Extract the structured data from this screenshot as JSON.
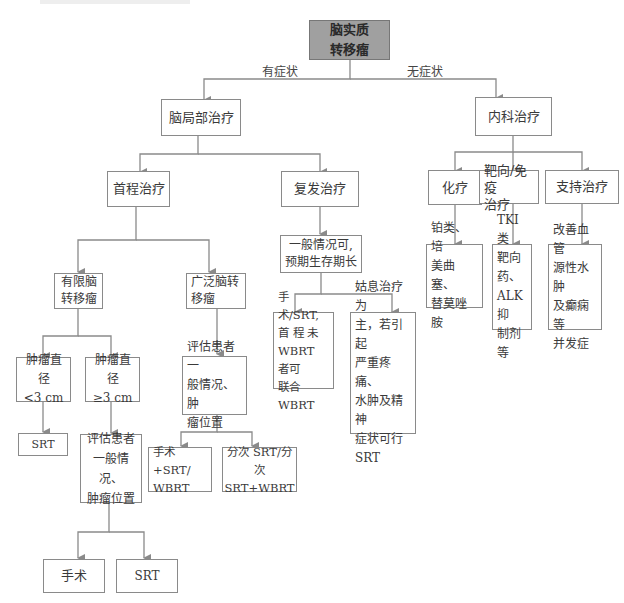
{
  "diagram": {
    "type": "flowchart",
    "root": {
      "id": "root",
      "label": "脑实质\n转移瘤"
    },
    "edge_labels": {
      "symptomatic": "有症状",
      "asymptomatic": "无症状"
    },
    "nodes": {
      "local_treatment": "脑局部治疗",
      "medical_treatment": "内科治疗",
      "first_line": "首程治疗",
      "recurrence": "复发治疗",
      "chemo": "化疗",
      "targeted_immuno": "靶向/免疫\n治疗",
      "supportive": "支持治疗",
      "chemo_detail": "铂类、培\n美曲塞、\n替莫唑胺",
      "targeted_detail": "TKI 类\n靶向药、\nALK 抑\n制剂等",
      "supportive_detail": "改善血管\n源性水肿\n及癫痫等\n并发症",
      "good_condition": "一般情况可,\n预期生存期长",
      "recur_surgery": "手术/SRT,\n首 程 未\nWBRT 者可\n联合 WBRT",
      "recur_palliative": "姑息治疗为\n主，若引起\n严重疼痛、\n水肿及精神\n症状可行\nSRT",
      "limited_mets": "有限脑\n转移瘤",
      "extensive_mets": "广泛脑转\n移瘤",
      "tumor_lt3": "肿瘤直径\n<3 cm",
      "tumor_ge3": "肿瘤直径\n≥3 cm",
      "srt_small": "SRT",
      "assess_ge3": "评估患者\n一般情况、\n肿瘤位置",
      "assess_ext": "评估患者一\n般情况、肿\n瘤位置",
      "surgery_srt_wbrt": "手术+SRT/\nWBRT",
      "fractionated": "分次 SRT/分\n次 SRT+WBRT",
      "surgery": "手术",
      "srt_large": "SRT"
    }
  }
}
